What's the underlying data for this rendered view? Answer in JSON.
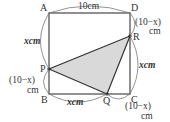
{
  "figure": {
    "type": "geometry-square-with-inscribed-triangle",
    "colors": {
      "square_stroke": "#555555",
      "triangle_stroke": "#333333",
      "triangle_fill": "#d9d9d9",
      "brace_stroke": "#777777",
      "text": "#333333"
    },
    "vertices": {
      "A": {
        "label": "A",
        "x": 49,
        "y": 13
      },
      "D": {
        "label": "D",
        "x": 130,
        "y": 13
      },
      "B": {
        "label": "B",
        "x": 49,
        "y": 94
      },
      "C": {
        "label": "C",
        "x": 130,
        "y": 94
      },
      "P": {
        "label": "P",
        "x": 49,
        "y": 69
      },
      "Q": {
        "label": "Q",
        "x": 107,
        "y": 94
      },
      "R": {
        "label": "R",
        "x": 130,
        "y": 36
      }
    },
    "measurements": {
      "AD": "10cm",
      "AP": "xcm",
      "PB_line1": "(10−x)",
      "PB_line2": "cm",
      "BQ": "xcm",
      "QC_line1": "(10−x)",
      "QC_line2": "cm",
      "DR_line1": "(10−x)",
      "DR_line2": "cm",
      "RC": "xcm"
    },
    "shaded_region": "triangle PQR"
  }
}
